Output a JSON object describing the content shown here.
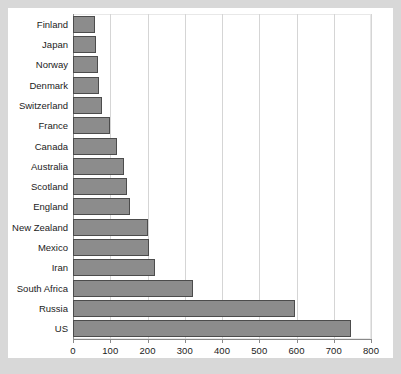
{
  "chart_data": {
    "type": "bar",
    "orientation": "horizontal",
    "title": "",
    "xlabel": "",
    "ylabel": "",
    "xlim": [
      0,
      800
    ],
    "ylim": null,
    "grid": true,
    "legend": null,
    "xticks": [
      0,
      100,
      200,
      300,
      400,
      500,
      600,
      700,
      800
    ],
    "xtick_labels": [
      "0",
      "100",
      "200",
      "300",
      "400",
      "500",
      "600",
      "700",
      "800"
    ],
    "categories": [
      "Finland",
      "Japan",
      "Norway",
      "Denmark",
      "Switzerland",
      "France",
      "Canada",
      "Australia",
      "Scotland",
      "England",
      "New Zealand",
      "Mexico",
      "Iran",
      "South Africa",
      "Russia",
      "US"
    ],
    "values": [
      58,
      61,
      66,
      69,
      79,
      100,
      117,
      138,
      144,
      152,
      200,
      205,
      221,
      323,
      597,
      745
    ]
  },
  "colors": {
    "page_background": "#d8d8d8",
    "figure_background": "#ffffff",
    "bar_fill": "#8c8c8c",
    "bar_stroke": "#4c4c4c",
    "gridline": "#d5d5d5",
    "axis": "#8a8a8a",
    "text": "#1b1b1b"
  }
}
